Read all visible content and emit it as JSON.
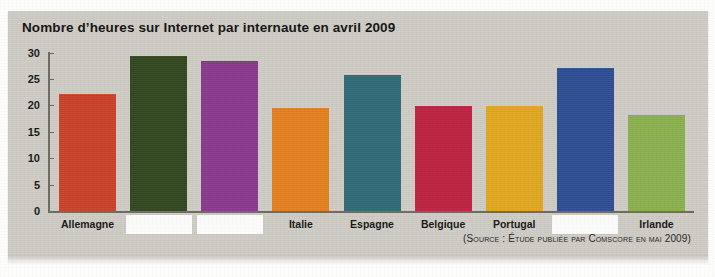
{
  "panel": {
    "background_color": "#cfccc5"
  },
  "chart_data": {
    "type": "bar",
    "title": "Nombre d’heures sur Internet par internaute en avril 2009",
    "xlabel": "",
    "ylabel": "",
    "ylim": [
      0,
      30
    ],
    "yticks": [
      0,
      5,
      10,
      15,
      20,
      25,
      30
    ],
    "ytick_labels": [
      "0",
      "5",
      "10",
      "15",
      "20",
      "25",
      "30"
    ],
    "grid": false,
    "legend": "none",
    "categories": [
      "Allemagne",
      "",
      "",
      "Italie",
      "Espagne",
      "Belgique",
      "Portugal",
      "",
      "Irlande"
    ],
    "values": [
      22.2,
      29.4,
      28.4,
      19.5,
      25.7,
      19.8,
      19.9,
      27.1,
      18.2
    ],
    "bar_colors": [
      "#cc4229",
      "#32481f",
      "#8a3a8c",
      "#e5811f",
      "#316b78",
      "#bf2342",
      "#e3a81f",
      "#2e4e94",
      "#8cb24e"
    ],
    "redacted_indices": [
      1,
      2,
      7
    ],
    "annotations": [
      "(Source : Étude publiée par Comscore en mai 2009)"
    ]
  },
  "source_note": "(Source : Étude publiée par Comscore en mai 2009)"
}
